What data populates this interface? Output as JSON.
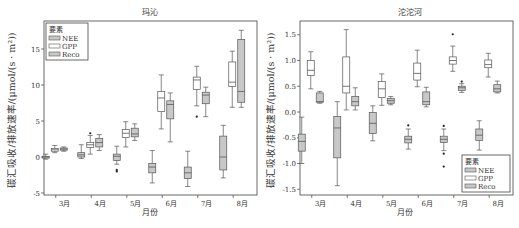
{
  "chart_data": [
    {
      "type": "box",
      "title": "玛沁",
      "xlabel": "月份",
      "ylabel": "碳汇吸收/排放速率/(μmol/(s · m²))",
      "categories": [
        "3月",
        "4月",
        "5月",
        "6月",
        "7月",
        "8月"
      ],
      "ylim": [
        -5.5,
        18.5
      ],
      "yticks": [
        -5,
        0,
        5,
        10,
        15
      ],
      "legend": {
        "title": "要素",
        "position": "upper-left",
        "entries": [
          "NEE",
          "GPP",
          "Reco"
        ]
      },
      "grid": false,
      "series": [
        {
          "name": "NEE",
          "fill": "#c8c8c8",
          "boxes": [
            {
              "min": -0.3,
              "q1": -0.15,
              "median": 0.0,
              "q3": 0.1,
              "max": 0.4,
              "outliers": []
            },
            {
              "min": -0.2,
              "q1": 0.0,
              "median": 0.3,
              "q3": 0.6,
              "max": 1.7,
              "outliers": []
            },
            {
              "min": -1.0,
              "q1": -0.5,
              "median": 0.1,
              "q3": 0.4,
              "max": 1.5,
              "outliers": [
                -1.8,
                -2.0
              ]
            },
            {
              "min": -3.6,
              "q1": -2.2,
              "median": -1.4,
              "q3": -0.9,
              "max": 0.9,
              "outliers": []
            },
            {
              "min": -4.1,
              "q1": -3.0,
              "median": -2.2,
              "q3": -1.4,
              "max": 0.8,
              "outliers": []
            },
            {
              "min": -2.9,
              "q1": -1.8,
              "median": 0.0,
              "q3": 2.9,
              "max": 4.4,
              "outliers": []
            }
          ]
        },
        {
          "name": "GPP",
          "fill": "#ffffff",
          "boxes": [
            {
              "min": 0.6,
              "q1": 0.8,
              "median": 1.0,
              "q3": 1.2,
              "max": 1.6,
              "outliers": []
            },
            {
              "min": 0.4,
              "q1": 1.3,
              "median": 1.7,
              "q3": 2.0,
              "max": 3.0,
              "outliers": [
                3.3
              ]
            },
            {
              "min": 1.4,
              "q1": 2.7,
              "median": 3.3,
              "q3": 3.8,
              "max": 4.9,
              "outliers": []
            },
            {
              "min": 3.9,
              "q1": 6.3,
              "median": 8.2,
              "q3": 9.1,
              "max": 11.4,
              "outliers": []
            },
            {
              "min": 7.1,
              "q1": 9.4,
              "median": 10.7,
              "q3": 11.1,
              "max": 12.6,
              "outliers": [
                5.6
              ]
            },
            {
              "min": 6.9,
              "q1": 9.8,
              "median": 10.4,
              "q3": 13.2,
              "max": 14.7,
              "outliers": []
            }
          ]
        },
        {
          "name": "Reco",
          "fill": "#c8c8c8",
          "boxes": [
            {
              "min": 0.8,
              "q1": 0.95,
              "median": 1.1,
              "q3": 1.25,
              "max": 1.4,
              "outliers": []
            },
            {
              "min": 0.9,
              "q1": 1.4,
              "median": 2.0,
              "q3": 2.6,
              "max": 3.1,
              "outliers": []
            },
            {
              "min": 2.3,
              "q1": 2.8,
              "median": 3.2,
              "q3": 4.0,
              "max": 4.6,
              "outliers": []
            },
            {
              "min": 2.1,
              "q1": 5.3,
              "median": 7.3,
              "q3": 7.8,
              "max": 8.9,
              "outliers": []
            },
            {
              "min": 5.6,
              "q1": 7.4,
              "median": 8.6,
              "q3": 9.0,
              "max": 9.7,
              "outliers": []
            },
            {
              "min": 6.9,
              "q1": 7.6,
              "median": 9.1,
              "q3": 16.3,
              "max": 17.6,
              "outliers": []
            }
          ]
        }
      ]
    },
    {
      "type": "box",
      "title": "沱沱河",
      "xlabel": "月份",
      "ylabel": "碳汇吸收/排放速率/(μmol/(s · m²))",
      "categories": [
        "3月",
        "4月",
        "5月",
        "6月",
        "7月",
        "8月"
      ],
      "ylim": [
        -1.6,
        1.75
      ],
      "yticks": [
        -1.5,
        -1.0,
        -0.5,
        0.0,
        0.5,
        1.0,
        1.5
      ],
      "legend": {
        "title": "要素",
        "position": "lower-right",
        "entries": [
          "NEE",
          "GPP",
          "Reco"
        ]
      },
      "grid": false,
      "series": [
        {
          "name": "NEE",
          "fill": "#c8c8c8",
          "boxes": [
            {
              "min": -1.0,
              "q1": -0.76,
              "median": -0.57,
              "q3": -0.43,
              "max": -0.1,
              "outliers": []
            },
            {
              "min": -1.43,
              "q1": -0.89,
              "median": -0.31,
              "q3": -0.09,
              "max": 0.2,
              "outliers": []
            },
            {
              "min": -0.56,
              "q1": -0.42,
              "median": -0.22,
              "q3": -0.01,
              "max": 0.12,
              "outliers": []
            },
            {
              "min": -0.72,
              "q1": -0.6,
              "median": -0.53,
              "q3": -0.47,
              "max": -0.33,
              "outliers": [
                -0.26
              ]
            },
            {
              "min": -0.75,
              "q1": -0.59,
              "median": -0.53,
              "q3": -0.47,
              "max": -0.33,
              "outliers": [
                -0.27,
                -0.81,
                -1.06
              ]
            },
            {
              "min": -0.74,
              "q1": -0.55,
              "median": -0.45,
              "q3": -0.33,
              "max": -0.17,
              "outliers": []
            }
          ]
        },
        {
          "name": "GPP",
          "fill": "#ffffff",
          "boxes": [
            {
              "min": 0.45,
              "q1": 0.71,
              "median": 0.81,
              "q3": 1.0,
              "max": 1.17,
              "outliers": []
            },
            {
              "min": 0.04,
              "q1": 0.37,
              "median": 0.5,
              "q3": 1.07,
              "max": 1.6,
              "outliers": []
            },
            {
              "min": 0.13,
              "q1": 0.28,
              "median": 0.45,
              "q3": 0.59,
              "max": 0.74,
              "outliers": []
            },
            {
              "min": 0.49,
              "q1": 0.62,
              "median": 0.75,
              "q3": 0.95,
              "max": 1.2,
              "outliers": []
            },
            {
              "min": 0.79,
              "q1": 0.93,
              "median": 1.0,
              "q3": 1.07,
              "max": 1.28,
              "outliers": [
                1.51
              ]
            },
            {
              "min": 0.68,
              "q1": 0.86,
              "median": 0.92,
              "q3": 1.01,
              "max": 1.14,
              "outliers": []
            }
          ]
        },
        {
          "name": "Reco",
          "fill": "#c8c8c8",
          "boxes": [
            {
              "min": 0.17,
              "q1": 0.19,
              "median": 0.2,
              "q3": 0.37,
              "max": 0.4,
              "outliers": []
            },
            {
              "min": 0.04,
              "q1": 0.12,
              "median": 0.2,
              "q3": 0.3,
              "max": 0.47,
              "outliers": []
            },
            {
              "min": 0.14,
              "q1": 0.17,
              "median": 0.22,
              "q3": 0.26,
              "max": 0.3,
              "outliers": []
            },
            {
              "min": 0.1,
              "q1": 0.14,
              "median": 0.2,
              "q3": 0.39,
              "max": 0.48,
              "outliers": []
            },
            {
              "min": 0.38,
              "q1": 0.42,
              "median": 0.47,
              "q3": 0.5,
              "max": 0.55,
              "outliers": [
                0.59
              ]
            },
            {
              "min": 0.37,
              "q1": 0.39,
              "median": 0.45,
              "q3": 0.53,
              "max": 0.6,
              "outliers": []
            }
          ]
        }
      ]
    }
  ],
  "colors": {
    "axis": "#444444",
    "box_stroke": "#555555",
    "gray_fill": "#c8c8c8",
    "white_fill": "#ffffff",
    "text": "#333333"
  }
}
